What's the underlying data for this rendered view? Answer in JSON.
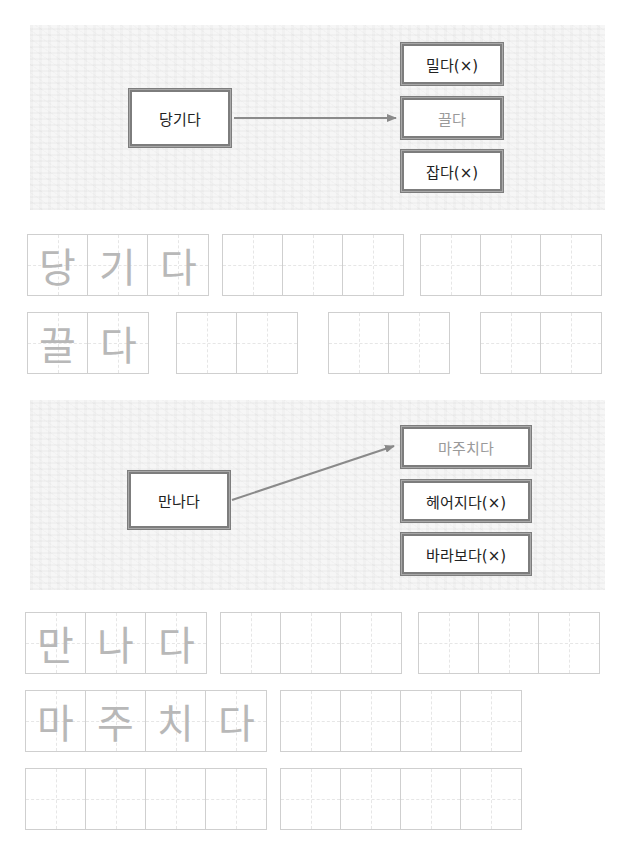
{
  "exercise_1": {
    "source_word": "당기다",
    "options": [
      {
        "label": "밀다(×)",
        "correct": false
      },
      {
        "label": "끌다",
        "correct": true
      },
      {
        "label": "잡다(×)",
        "correct": false
      }
    ],
    "practice_rows": [
      {
        "guide": [
          "당",
          "기",
          "다"
        ],
        "groups": [
          3,
          3,
          3
        ]
      },
      {
        "guide": [
          "끌",
          "다"
        ],
        "groups": [
          2,
          2,
          2,
          2
        ]
      }
    ]
  },
  "exercise_2": {
    "source_word": "만나다",
    "options": [
      {
        "label": "마주치다",
        "correct": true
      },
      {
        "label": "헤어지다(×)",
        "correct": false
      },
      {
        "label": "바라보다(×)",
        "correct": false
      }
    ],
    "practice_rows": [
      {
        "guide": [
          "만",
          "나",
          "다"
        ],
        "groups": [
          3,
          3,
          3
        ]
      },
      {
        "guide": [
          "마",
          "주",
          "치",
          "다"
        ],
        "groups": [
          4,
          4
        ]
      },
      {
        "guide": [],
        "groups": [
          4,
          4
        ]
      }
    ]
  },
  "colors": {
    "box_border": "#7d7d7d",
    "arrow": "#8a8a8a",
    "answer_text": "#9a9a9a",
    "guide_text": "#b8b8b8",
    "grid_line": "#cfcfcf"
  }
}
